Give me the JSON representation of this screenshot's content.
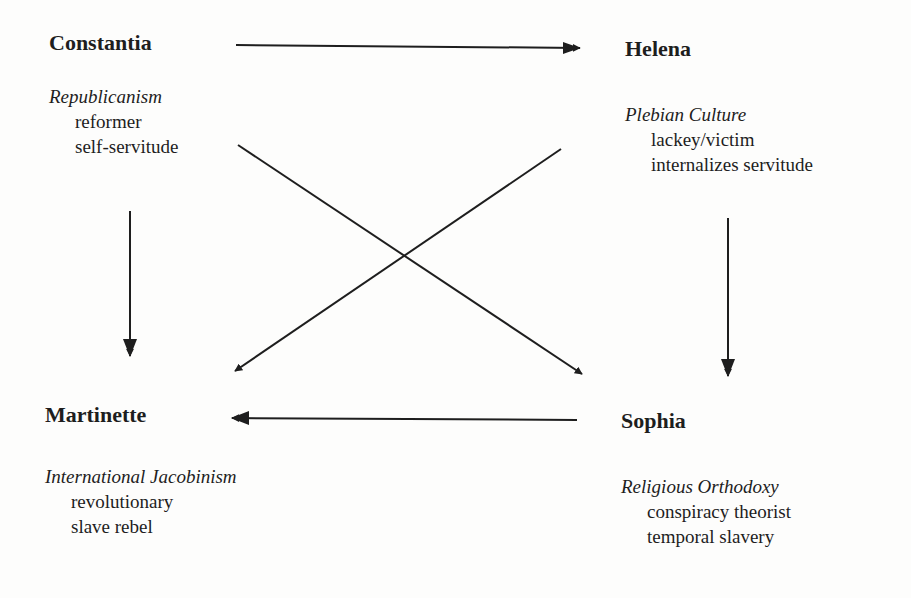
{
  "nodes": {
    "constantia": {
      "name": "Constantia",
      "ideology": "Republicanism",
      "traits": [
        "reformer",
        "self-servitude"
      ]
    },
    "helena": {
      "name": "Helena",
      "ideology": "Plebian Culture",
      "traits": [
        "lackey/victim",
        "internalizes servitude"
      ]
    },
    "martinette": {
      "name": "Martinette",
      "ideology": "International Jacobinism",
      "traits": [
        "revolutionary",
        "slave rebel"
      ]
    },
    "sophia": {
      "name": "Sophia",
      "ideology": "Religious Orthodoxy",
      "traits": [
        "conspiracy theorist",
        "temporal slavery"
      ]
    }
  },
  "edges": [
    {
      "from": "Constantia",
      "to": "Helena"
    },
    {
      "from": "Constantia",
      "to": "Martinette"
    },
    {
      "from": "Constantia",
      "to": "Sophia"
    },
    {
      "from": "Helena",
      "to": "Martinette"
    },
    {
      "from": "Helena",
      "to": "Sophia"
    },
    {
      "from": "Sophia",
      "to": "Martinette"
    }
  ]
}
